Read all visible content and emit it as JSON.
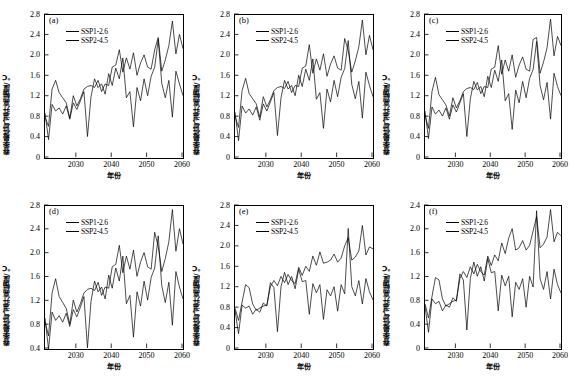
{
  "figure": {
    "type": "multi-panel-line-chart",
    "rows": 2,
    "cols": 3,
    "shared_xlabel": "年份",
    "shared_ylabel": "春季最低气温升高幅度/℃",
    "series_names": [
      "SSP1-2.6",
      "SSP2-4.5"
    ],
    "line_color": "#000000"
  },
  "chart_data": [
    {
      "type": "line",
      "panel": "(a)",
      "title": "",
      "xlabel": "年份",
      "ylabel": "春季最低气温升高幅度/℃",
      "xlim": [
        2021,
        2060
      ],
      "ylim": [
        0,
        2.8
      ],
      "xticks": [
        2030,
        2040,
        2050,
        2060
      ],
      "yticks": [
        "0",
        "0.4",
        "0.8",
        "1.2",
        "1.6",
        "2.0",
        "2.4",
        "2.8"
      ],
      "grid": false,
      "legend_position": "upper-left",
      "x": [
        2021,
        2022,
        2023,
        2024,
        2025,
        2026,
        2027,
        2028,
        2029,
        2030,
        2031,
        2032,
        2033,
        2034,
        2035,
        2036,
        2037,
        2038,
        2039,
        2040,
        2041,
        2042,
        2043,
        2044,
        2045,
        2046,
        2047,
        2048,
        2049,
        2050,
        2051,
        2052,
        2053,
        2054,
        2055,
        2056,
        2057,
        2058,
        2059,
        2060
      ],
      "series": [
        {
          "name": "SSP1-2.6",
          "values": [
            0.88,
            0.36,
            1.05,
            0.92,
            0.98,
            0.86,
            1.02,
            0.76,
            1.08,
            0.95,
            1.12,
            1.3,
            0.42,
            1.2,
            1.55,
            1.38,
            1.45,
            1.25,
            1.65,
            1.42,
            1.76,
            1.55,
            1.96,
            1.18,
            1.3,
            0.61,
            1.38,
            1.12,
            1.55,
            1.22,
            1.6,
            1.78,
            2.32,
            1.46,
            1.18,
            1.52,
            0.8,
            1.7,
            1.45,
            1.22
          ]
        },
        {
          "name": "SSP2-4.5",
          "values": [
            0.8,
            0.62,
            1.35,
            1.52,
            1.28,
            1.18,
            1.08,
            0.78,
            1.22,
            1.02,
            1.16,
            1.35,
            1.4,
            1.42,
            1.38,
            1.52,
            1.3,
            1.45,
            1.42,
            1.78,
            1.82,
            2.12,
            1.68,
            1.96,
            1.74,
            2.06,
            1.62,
            1.86,
            2.02,
            1.78,
            1.74,
            2.12,
            2.36,
            1.7,
            1.92,
            2.2,
            2.68,
            2.04,
            2.42,
            2.14
          ]
        }
      ]
    },
    {
      "type": "line",
      "panel": "(b)",
      "title": "",
      "xlabel": "年份",
      "ylabel": "春季最低气温升高幅度/℃",
      "xlim": [
        2021,
        2060
      ],
      "ylim": [
        0,
        2.8
      ],
      "xticks": [
        2030,
        2040,
        2050,
        2060
      ],
      "yticks": [
        "0",
        "0.4",
        "0.8",
        "1.2",
        "1.6",
        "2.0",
        "2.4",
        "2.8"
      ],
      "grid": false,
      "legend_position": "upper-left",
      "x": [
        2021,
        2022,
        2023,
        2024,
        2025,
        2026,
        2027,
        2028,
        2029,
        2030,
        2031,
        2032,
        2033,
        2034,
        2035,
        2036,
        2037,
        2038,
        2039,
        2040,
        2041,
        2042,
        2043,
        2044,
        2045,
        2046,
        2047,
        2048,
        2049,
        2050,
        2051,
        2052,
        2053,
        2054,
        2055,
        2056,
        2057,
        2058,
        2059,
        2060
      ],
      "series": [
        {
          "name": "SSP1-2.6",
          "values": [
            0.9,
            0.34,
            1.02,
            0.88,
            0.96,
            0.84,
            1.0,
            0.74,
            1.06,
            0.92,
            1.1,
            1.28,
            0.44,
            1.18,
            1.52,
            1.35,
            1.42,
            1.22,
            1.62,
            1.4,
            1.74,
            1.52,
            1.94,
            1.15,
            1.28,
            0.58,
            1.35,
            1.1,
            1.52,
            1.2,
            1.58,
            1.75,
            2.3,
            1.44,
            1.16,
            1.5,
            0.78,
            1.68,
            1.42,
            1.2
          ]
        },
        {
          "name": "SSP2-4.5",
          "values": [
            0.82,
            0.6,
            1.32,
            1.56,
            1.26,
            1.16,
            1.06,
            0.8,
            1.2,
            1.0,
            1.14,
            1.32,
            1.38,
            1.4,
            1.36,
            1.5,
            1.28,
            1.42,
            1.4,
            1.76,
            1.8,
            2.22,
            1.66,
            1.94,
            1.72,
            2.04,
            1.6,
            1.84,
            2.0,
            1.76,
            1.72,
            2.34,
            2.1,
            1.68,
            1.9,
            2.18,
            2.7,
            2.02,
            2.4,
            2.12
          ]
        }
      ]
    },
    {
      "type": "line",
      "panel": "(c)",
      "title": "",
      "xlabel": "年份",
      "ylabel": "春季最低气温升高幅度/℃",
      "xlim": [
        2021,
        2060
      ],
      "ylim": [
        0,
        2.8
      ],
      "xticks": [
        2030,
        2040,
        2050,
        2060
      ],
      "yticks": [
        "0",
        "0.4",
        "0.8",
        "1.2",
        "1.6",
        "2.0",
        "2.4",
        "2.8"
      ],
      "grid": false,
      "legend_position": "upper-left",
      "x": [
        2021,
        2022,
        2023,
        2024,
        2025,
        2026,
        2027,
        2028,
        2029,
        2030,
        2031,
        2032,
        2033,
        2034,
        2035,
        2036,
        2037,
        2038,
        2039,
        2040,
        2041,
        2042,
        2043,
        2044,
        2045,
        2046,
        2047,
        2048,
        2049,
        2050,
        2051,
        2052,
        2053,
        2054,
        2055,
        2056,
        2057,
        2058,
        2059,
        2060
      ],
      "series": [
        {
          "name": "SSP1-2.6",
          "values": [
            0.92,
            0.38,
            1.0,
            0.86,
            0.94,
            0.82,
            0.98,
            0.76,
            1.04,
            0.9,
            1.08,
            1.26,
            0.42,
            1.16,
            1.5,
            1.33,
            1.4,
            1.2,
            1.6,
            1.38,
            1.72,
            1.5,
            1.92,
            1.12,
            1.26,
            0.56,
            1.33,
            1.08,
            1.5,
            1.18,
            1.56,
            1.73,
            2.28,
            1.42,
            1.14,
            1.48,
            0.76,
            1.66,
            1.4,
            1.22
          ]
        },
        {
          "name": "SSP2-4.5",
          "values": [
            0.84,
            0.58,
            1.3,
            1.58,
            1.24,
            1.14,
            1.04,
            0.82,
            1.18,
            0.98,
            1.12,
            1.3,
            1.36,
            1.38,
            1.34,
            1.48,
            1.26,
            1.4,
            1.38,
            1.74,
            1.78,
            2.2,
            1.64,
            1.92,
            1.7,
            2.02,
            1.58,
            1.82,
            1.98,
            1.74,
            1.7,
            2.32,
            2.36,
            1.66,
            1.88,
            2.16,
            2.72,
            2.0,
            2.38,
            2.2
          ]
        }
      ]
    },
    {
      "type": "line",
      "panel": "(d)",
      "title": "",
      "xlabel": "年份",
      "ylabel": "春季最低气温升高幅度/℃",
      "xlim": [
        2021,
        2060
      ],
      "ylim": [
        0.4,
        2.8
      ],
      "xticks": [
        2030,
        2040,
        2050,
        2060
      ],
      "yticks": [
        "0.4",
        "0.8",
        "1.2",
        "1.6",
        "2.0",
        "2.4",
        "2.8"
      ],
      "grid": false,
      "legend_position": "upper-left",
      "x": [
        2021,
        2022,
        2023,
        2024,
        2025,
        2026,
        2027,
        2028,
        2029,
        2030,
        2031,
        2032,
        2033,
        2034,
        2035,
        2036,
        2037,
        2038,
        2039,
        2040,
        2041,
        2042,
        2043,
        2044,
        2045,
        2046,
        2047,
        2048,
        2049,
        2050,
        2051,
        2052,
        2053,
        2054,
        2055,
        2056,
        2057,
        2058,
        2059,
        2060
      ],
      "series": [
        {
          "name": "SSP1-2.6",
          "values": [
            0.92,
            0.4,
            1.02,
            0.88,
            0.96,
            0.85,
            1.0,
            0.78,
            1.06,
            0.94,
            1.1,
            1.28,
            0.42,
            1.2,
            1.54,
            1.36,
            1.44,
            1.24,
            1.64,
            1.42,
            1.76,
            1.54,
            1.96,
            1.16,
            1.3,
            0.6,
            1.36,
            1.12,
            1.54,
            1.22,
            1.6,
            1.76,
            2.3,
            1.46,
            1.18,
            1.52,
            0.8,
            1.7,
            1.44,
            1.24
          ]
        },
        {
          "name": "SSP2-4.5",
          "values": [
            0.86,
            0.62,
            1.34,
            1.58,
            1.28,
            1.18,
            1.08,
            0.82,
            1.22,
            1.02,
            1.16,
            1.34,
            1.4,
            1.42,
            1.38,
            1.52,
            1.3,
            1.44,
            1.42,
            1.78,
            1.82,
            2.14,
            1.68,
            1.96,
            1.74,
            2.06,
            1.62,
            1.86,
            2.02,
            1.78,
            1.74,
            2.36,
            2.12,
            1.7,
            1.92,
            2.2,
            2.74,
            2.04,
            2.42,
            2.16
          ]
        }
      ]
    },
    {
      "type": "line",
      "panel": "(e)",
      "title": "",
      "xlabel": "年份",
      "ylabel": "春季最低气温升高幅度/℃",
      "xlim": [
        2021,
        2060
      ],
      "ylim": [
        0,
        2.8
      ],
      "xticks": [
        2030,
        2040,
        2050,
        2060
      ],
      "yticks": [
        "0",
        "0.4",
        "0.8",
        "1.2",
        "1.6",
        "2.0",
        "2.4",
        "2.8"
      ],
      "grid": false,
      "legend_position": "upper-left",
      "x": [
        2021,
        2022,
        2023,
        2024,
        2025,
        2026,
        2027,
        2028,
        2029,
        2030,
        2031,
        2032,
        2033,
        2034,
        2035,
        2036,
        2037,
        2038,
        2039,
        2040,
        2041,
        2042,
        2043,
        2044,
        2045,
        2046,
        2047,
        2048,
        2049,
        2050,
        2051,
        2052,
        2053,
        2054,
        2055,
        2056,
        2057,
        2058,
        2059,
        2060
      ],
      "series": [
        {
          "name": "SSP1-2.6",
          "values": [
            0.76,
            0.3,
            0.86,
            0.8,
            0.84,
            0.68,
            0.78,
            0.72,
            0.9,
            0.84,
            1.3,
            1.2,
            0.34,
            1.22,
            1.5,
            1.26,
            1.42,
            1.18,
            1.56,
            1.32,
            1.34,
            0.68,
            1.28,
            1.1,
            1.26,
            0.58,
            1.16,
            1.04,
            1.22,
            0.74,
            1.26,
            1.08,
            2.36,
            1.22,
            1.04,
            1.34,
            0.88,
            1.38,
            1.12,
            0.96
          ]
        },
        {
          "name": "SSP2-4.5",
          "values": [
            0.8,
            0.56,
            0.92,
            1.26,
            1.2,
            0.88,
            0.76,
            0.8,
            0.84,
            0.86,
            1.22,
            1.34,
            1.24,
            1.42,
            1.3,
            1.46,
            1.34,
            1.28,
            1.6,
            1.44,
            1.62,
            1.52,
            1.82,
            1.64,
            1.9,
            1.68,
            1.7,
            1.74,
            1.86,
            1.7,
            1.78,
            2.02,
            2.18,
            1.74,
            1.8,
            1.92,
            2.42,
            1.84,
            2.0,
            1.96
          ]
        }
      ]
    },
    {
      "type": "line",
      "panel": "(f)",
      "title": "",
      "xlabel": "年份",
      "ylabel": "春季最低气温升高幅度/℃",
      "xlim": [
        2021,
        2060
      ],
      "ylim": [
        0,
        2.4
      ],
      "xticks": [
        2030,
        2040,
        2050,
        2060
      ],
      "yticks": [
        "0",
        "0.4",
        "0.8",
        "1.2",
        "1.6",
        "2.0",
        "2.4"
      ],
      "grid": false,
      "legend_position": "upper-left",
      "x": [
        2021,
        2022,
        2023,
        2024,
        2025,
        2026,
        2027,
        2028,
        2029,
        2030,
        2031,
        2032,
        2033,
        2034,
        2035,
        2036,
        2037,
        2038,
        2039,
        2040,
        2041,
        2042,
        2043,
        2044,
        2045,
        2046,
        2047,
        2048,
        2049,
        2050,
        2051,
        2052,
        2053,
        2054,
        2055,
        2056,
        2057,
        2058,
        2059,
        2060
      ],
      "series": [
        {
          "name": "SSP1-2.6",
          "values": [
            0.72,
            0.28,
            0.84,
            0.76,
            0.8,
            0.64,
            0.74,
            0.7,
            0.86,
            0.8,
            1.26,
            1.16,
            0.32,
            1.18,
            1.46,
            1.22,
            1.38,
            1.14,
            1.52,
            1.28,
            1.3,
            0.64,
            1.24,
            1.06,
            1.22,
            0.54,
            1.12,
            1.0,
            1.18,
            0.7,
            1.22,
            1.04,
            2.32,
            1.18,
            1.0,
            1.3,
            0.84,
            1.34,
            1.08,
            0.94
          ]
        },
        {
          "name": "SSP2-4.5",
          "values": [
            0.76,
            0.52,
            0.88,
            1.2,
            1.16,
            0.84,
            0.72,
            0.76,
            0.8,
            0.82,
            1.18,
            1.3,
            1.2,
            1.38,
            1.26,
            1.42,
            1.3,
            1.24,
            1.56,
            1.4,
            1.58,
            1.48,
            1.78,
            1.6,
            1.86,
            2.02,
            1.66,
            1.7,
            1.82,
            1.66,
            1.74,
            1.98,
            2.22,
            1.7,
            1.76,
            1.88,
            2.34,
            1.8,
            1.96,
            1.9
          ]
        }
      ]
    }
  ]
}
